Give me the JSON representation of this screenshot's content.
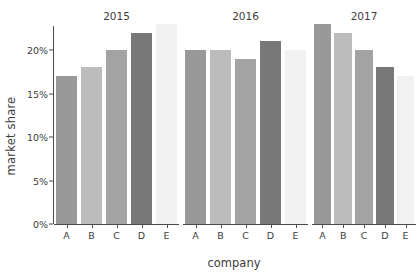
{
  "chart_data": {
    "type": "bar",
    "title": "",
    "xlabel": "company",
    "ylabel": "market share",
    "categories": [
      "A",
      "B",
      "C",
      "D",
      "E"
    ],
    "ylim": [
      0,
      24
    ],
    "ytick_values": [
      0,
      5,
      10,
      15,
      20
    ],
    "ytick_labels": [
      "0%",
      "5%",
      "10%",
      "15%",
      "20%"
    ],
    "grid": false,
    "legend": "none",
    "facet_by": "year",
    "panels": [
      {
        "title": "2015",
        "categories": [
          "A",
          "B",
          "C",
          "D",
          "E"
        ],
        "values": [
          17,
          18,
          20,
          22,
          23
        ]
      },
      {
        "title": "2016",
        "categories": [
          "A",
          "B",
          "C",
          "D",
          "E"
        ],
        "values": [
          20,
          20,
          19,
          21,
          20
        ]
      },
      {
        "title": "2017",
        "categories": [
          "A",
          "B",
          "C",
          "D",
          "E"
        ],
        "values": [
          23,
          22,
          20,
          18,
          17
        ]
      }
    ],
    "series": [
      {
        "name": "2015",
        "values": [
          17,
          18,
          20,
          22,
          23
        ]
      },
      {
        "name": "2016",
        "values": [
          20,
          20,
          19,
          21,
          20
        ]
      },
      {
        "name": "2017",
        "values": [
          23,
          22,
          20,
          18,
          17
        ]
      }
    ],
    "bar_colors": {
      "A": "#999999",
      "B": "#bcbcbc",
      "C": "#a3a3a3",
      "D": "#787878",
      "E": "#f1f1f1"
    },
    "axis_color": "#4a4a4a",
    "text_color": "#3d3d3d",
    "background": "#ffffff"
  }
}
